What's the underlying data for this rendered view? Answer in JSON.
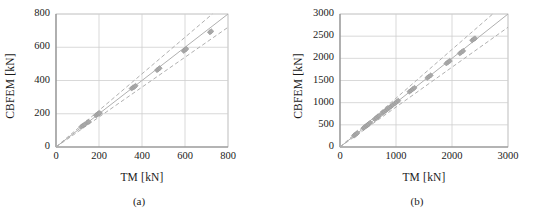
{
  "figure": {
    "background": "#ffffff",
    "marker_color": "#a8a8a8",
    "marker_edge_color": "#9a9a9a",
    "line_color": "#b0b0b0",
    "grid_color": "#cfcfcf",
    "axis_color": "#808080",
    "text_color": "#1a1a1a"
  },
  "panels": [
    {
      "id": "a",
      "subcaption": "(a)",
      "xlabel": "TM [kN]",
      "ylabel": "CBFEM [kN]",
      "xticks": [
        "0",
        "200",
        "400",
        "600",
        "800"
      ],
      "yticks": [
        "0",
        "200",
        "400",
        "600",
        "800"
      ]
    },
    {
      "id": "b",
      "subcaption": "(b)",
      "xlabel": "TM [kN]",
      "ylabel": "CBFEM [kN]",
      "xticks": [
        "0",
        "1000",
        "2000",
        "3000"
      ],
      "yticks": [
        "0",
        "500",
        "1000",
        "1500",
        "2000",
        "2500",
        "3000"
      ]
    }
  ],
  "chart_data": [
    {
      "type": "scatter",
      "panel": "a",
      "title": "",
      "xlabel": "TM [kN]",
      "ylabel": "CBFEM [kN]",
      "xlim": [
        0,
        800
      ],
      "ylim": [
        0,
        800
      ],
      "xticks": [
        0,
        200,
        400,
        600,
        800
      ],
      "yticks": [
        0,
        200,
        400,
        600,
        800
      ],
      "grid": true,
      "legend": "none",
      "marker": "diamond",
      "points": [
        {
          "x": 118,
          "y": 122
        },
        {
          "x": 126,
          "y": 130
        },
        {
          "x": 134,
          "y": 136
        },
        {
          "x": 146,
          "y": 148
        },
        {
          "x": 152,
          "y": 152
        },
        {
          "x": 186,
          "y": 190
        },
        {
          "x": 192,
          "y": 196
        },
        {
          "x": 198,
          "y": 200
        },
        {
          "x": 204,
          "y": 204
        },
        {
          "x": 352,
          "y": 352
        },
        {
          "x": 358,
          "y": 358
        },
        {
          "x": 364,
          "y": 362
        },
        {
          "x": 370,
          "y": 368
        },
        {
          "x": 470,
          "y": 462
        },
        {
          "x": 476,
          "y": 468
        },
        {
          "x": 482,
          "y": 474
        },
        {
          "x": 594,
          "y": 578
        },
        {
          "x": 600,
          "y": 584
        },
        {
          "x": 606,
          "y": 590
        },
        {
          "x": 716,
          "y": 690
        },
        {
          "x": 722,
          "y": 696
        }
      ],
      "reference_lines": [
        {
          "name": "equality",
          "style": "solid",
          "slope": 1.0,
          "intercept": 0
        },
        {
          "name": "upper-bound",
          "style": "dashed",
          "slope": 1.1,
          "intercept": 0
        },
        {
          "name": "lower-bound",
          "style": "dashed",
          "slope": 0.9,
          "intercept": 0
        }
      ]
    },
    {
      "type": "scatter",
      "panel": "b",
      "title": "",
      "xlabel": "TM [kN]",
      "ylabel": "CBFEM [kN]",
      "xlim": [
        0,
        3000
      ],
      "ylim": [
        0,
        3000
      ],
      "xticks": [
        0,
        1000,
        2000,
        3000
      ],
      "yticks": [
        0,
        500,
        1000,
        1500,
        2000,
        2500,
        3000
      ],
      "grid": true,
      "legend": "none",
      "marker": "diamond",
      "points": [
        {
          "x": 250,
          "y": 258
        },
        {
          "x": 270,
          "y": 278
        },
        {
          "x": 290,
          "y": 296
        },
        {
          "x": 310,
          "y": 318
        },
        {
          "x": 420,
          "y": 428
        },
        {
          "x": 440,
          "y": 448
        },
        {
          "x": 470,
          "y": 478
        },
        {
          "x": 490,
          "y": 498
        },
        {
          "x": 510,
          "y": 518
        },
        {
          "x": 540,
          "y": 548
        },
        {
          "x": 620,
          "y": 628
        },
        {
          "x": 650,
          "y": 658
        },
        {
          "x": 680,
          "y": 688
        },
        {
          "x": 700,
          "y": 706
        },
        {
          "x": 760,
          "y": 768
        },
        {
          "x": 790,
          "y": 796
        },
        {
          "x": 820,
          "y": 828
        },
        {
          "x": 850,
          "y": 856
        },
        {
          "x": 880,
          "y": 886
        },
        {
          "x": 910,
          "y": 916
        },
        {
          "x": 940,
          "y": 946
        },
        {
          "x": 980,
          "y": 986
        },
        {
          "x": 1010,
          "y": 1014
        },
        {
          "x": 1040,
          "y": 1044
        },
        {
          "x": 1240,
          "y": 1248
        },
        {
          "x": 1270,
          "y": 1276
        },
        {
          "x": 1300,
          "y": 1306
        },
        {
          "x": 1330,
          "y": 1334
        },
        {
          "x": 1560,
          "y": 1560
        },
        {
          "x": 1590,
          "y": 1588
        },
        {
          "x": 1620,
          "y": 1616
        },
        {
          "x": 1900,
          "y": 1886
        },
        {
          "x": 1930,
          "y": 1914
        },
        {
          "x": 1960,
          "y": 1942
        },
        {
          "x": 2140,
          "y": 2112
        },
        {
          "x": 2170,
          "y": 2140
        },
        {
          "x": 2200,
          "y": 2168
        },
        {
          "x": 2360,
          "y": 2406
        },
        {
          "x": 2390,
          "y": 2432
        },
        {
          "x": 2410,
          "y": 2450
        }
      ],
      "reference_lines": [
        {
          "name": "equality",
          "style": "solid",
          "slope": 1.0,
          "intercept": 0
        },
        {
          "name": "upper-bound",
          "style": "dashed",
          "slope": 1.1,
          "intercept": 0
        },
        {
          "name": "lower-bound",
          "style": "dashed",
          "slope": 0.9,
          "intercept": 0
        }
      ]
    }
  ]
}
